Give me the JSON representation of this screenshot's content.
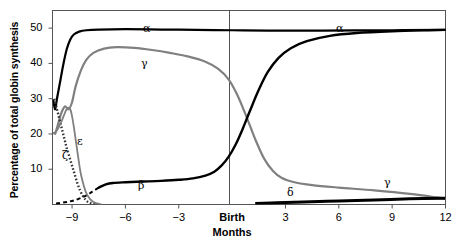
{
  "chart_data": {
    "type": "line",
    "title": "",
    "xlabel": "Months",
    "ylabel": "Percentage of total globin synthesis",
    "xlim": [
      -10.1,
      12
    ],
    "ylim": [
      0,
      55
    ],
    "grid": false,
    "legend_position": "inline-annotations",
    "x_ticks": [
      -9,
      -6,
      -3,
      0,
      3,
      6,
      9,
      12
    ],
    "x_tick_labels": [
      "−9",
      "−6",
      "−3",
      "Birth",
      "3",
      "6",
      "9",
      "12"
    ],
    "y_ticks": [
      10,
      20,
      30,
      40,
      50
    ],
    "y_tick_labels": [
      "10",
      "20",
      "30",
      "40",
      "50"
    ],
    "birth_marker_x": 0,
    "series": [
      {
        "name": "alpha",
        "label": "α",
        "color": "#000000",
        "style": "solid",
        "points": [
          [
            -10.05,
            29.5
          ],
          [
            -9.95,
            27.0
          ],
          [
            -9.85,
            30.0
          ],
          [
            -9.7,
            34.0
          ],
          [
            -9.5,
            39.5
          ],
          [
            -9.3,
            44.0
          ],
          [
            -9.1,
            46.8
          ],
          [
            -8.9,
            48.2
          ],
          [
            -8.6,
            49.0
          ],
          [
            -8.2,
            49.4
          ],
          [
            -7.5,
            49.6
          ],
          [
            -6.0,
            49.7
          ],
          [
            -4.0,
            49.6
          ],
          [
            -2.0,
            49.5
          ],
          [
            0.0,
            49.4
          ],
          [
            2.0,
            49.3
          ],
          [
            5.0,
            49.3
          ],
          [
            9.0,
            49.4
          ],
          [
            12.0,
            49.5
          ]
        ]
      },
      {
        "name": "gamma",
        "label": "γ",
        "color": "#808080",
        "style": "solid",
        "points": [
          [
            -9.95,
            20.0
          ],
          [
            -9.8,
            22.5
          ],
          [
            -9.6,
            26.0
          ],
          [
            -9.4,
            27.8
          ],
          [
            -9.2,
            27.0
          ],
          [
            -9.0,
            29.0
          ],
          [
            -8.8,
            33.5
          ],
          [
            -8.5,
            38.0
          ],
          [
            -8.2,
            41.0
          ],
          [
            -7.8,
            43.0
          ],
          [
            -7.2,
            44.2
          ],
          [
            -6.5,
            44.6
          ],
          [
            -5.5,
            44.4
          ],
          [
            -4.5,
            43.8
          ],
          [
            -3.5,
            43.0
          ],
          [
            -2.5,
            42.0
          ],
          [
            -1.5,
            40.5
          ],
          [
            -0.8,
            38.5
          ],
          [
            -0.2,
            35.5
          ],
          [
            0.3,
            31.0
          ],
          [
            0.8,
            25.0
          ],
          [
            1.3,
            18.5
          ],
          [
            1.8,
            13.0
          ],
          [
            2.3,
            9.5
          ],
          [
            2.8,
            7.5
          ],
          [
            3.5,
            6.3
          ],
          [
            4.5,
            5.5
          ],
          [
            6.0,
            4.8
          ],
          [
            8.0,
            4.0
          ],
          [
            10.0,
            3.0
          ],
          [
            11.5,
            2.0
          ],
          [
            12.0,
            1.6
          ]
        ]
      },
      {
        "name": "beta",
        "label": "β",
        "color": "#000000",
        "style": "mixed-dashed-solid",
        "points": [
          [
            -9.9,
            0.3
          ],
          [
            -9.3,
            0.7
          ],
          [
            -8.8,
            1.3
          ],
          [
            -8.3,
            2.3
          ],
          [
            -7.9,
            3.5
          ],
          [
            -7.5,
            4.8
          ],
          [
            -7.1,
            5.7
          ],
          [
            -6.7,
            6.1
          ],
          [
            -6.0,
            6.3
          ],
          [
            -5.0,
            6.5
          ],
          [
            -4.0,
            6.7
          ],
          [
            -3.0,
            7.0
          ],
          [
            -2.2,
            7.4
          ],
          [
            -1.5,
            8.2
          ],
          [
            -1.0,
            9.3
          ],
          [
            -0.6,
            11.0
          ],
          [
            -0.2,
            13.5
          ],
          [
            0.2,
            17.0
          ],
          [
            0.6,
            21.5
          ],
          [
            1.0,
            26.5
          ],
          [
            1.5,
            32.5
          ],
          [
            2.0,
            37.5
          ],
          [
            2.6,
            41.5
          ],
          [
            3.3,
            44.3
          ],
          [
            4.2,
            46.3
          ],
          [
            5.5,
            47.8
          ],
          [
            7.0,
            48.6
          ],
          [
            9.0,
            49.1
          ],
          [
            11.0,
            49.4
          ],
          [
            12.0,
            49.5
          ]
        ],
        "dashed_until_x": -7.7
      },
      {
        "name": "epsilon",
        "label": "ε",
        "color": "#333333",
        "style": "dotted",
        "points": [
          [
            -10.0,
            30.0
          ],
          [
            -9.9,
            28.0
          ],
          [
            -9.8,
            26.0
          ],
          [
            -9.7,
            24.0
          ],
          [
            -9.6,
            22.0
          ],
          [
            -9.5,
            20.0
          ],
          [
            -9.4,
            18.0
          ],
          [
            -9.3,
            16.0
          ],
          [
            -9.15,
            13.5
          ],
          [
            -9.0,
            11.0
          ],
          [
            -8.85,
            8.5
          ],
          [
            -8.7,
            6.0
          ],
          [
            -8.55,
            4.0
          ],
          [
            -8.4,
            2.5
          ],
          [
            -8.25,
            1.4
          ],
          [
            -8.1,
            0.7
          ],
          [
            -7.9,
            0.3
          ],
          [
            -7.7,
            0.1
          ]
        ]
      },
      {
        "name": "zeta",
        "label": "ζ",
        "color": "#808080",
        "style": "solid",
        "points": [
          [
            -10.05,
            20.2
          ],
          [
            -9.85,
            21.0
          ],
          [
            -9.6,
            23.5
          ],
          [
            -9.4,
            26.0
          ],
          [
            -9.25,
            27.4
          ],
          [
            -9.1,
            27.0
          ],
          [
            -9.0,
            25.0
          ],
          [
            -8.9,
            22.0
          ],
          [
            -8.8,
            18.5
          ],
          [
            -8.7,
            15.0
          ],
          [
            -8.6,
            11.5
          ],
          [
            -8.5,
            8.5
          ],
          [
            -8.35,
            5.5
          ],
          [
            -8.2,
            3.2
          ],
          [
            -8.0,
            1.6
          ],
          [
            -7.8,
            0.7
          ],
          [
            -7.6,
            0.3
          ],
          [
            -7.4,
            0.1
          ]
        ]
      },
      {
        "name": "delta",
        "label": "δ",
        "color": "#000000",
        "style": "solid-thick",
        "points": [
          [
            1.3,
            0.3
          ],
          [
            2.5,
            0.5
          ],
          [
            4.0,
            0.7
          ],
          [
            6.0,
            1.0
          ],
          [
            8.0,
            1.3
          ],
          [
            10.0,
            1.6
          ],
          [
            12.0,
            1.8
          ]
        ]
      }
    ],
    "annotations": [
      {
        "text": "α",
        "x": 143,
        "y": 22,
        "name": "alpha-label-left"
      },
      {
        "text": "α",
        "x": 336,
        "y": 22,
        "name": "alpha-label-right"
      },
      {
        "text": "γ",
        "x": 141,
        "y": 57,
        "name": "gamma-label-left"
      },
      {
        "text": "γ",
        "x": 384,
        "y": 176,
        "name": "gamma-label-right"
      },
      {
        "text": "β",
        "x": 138,
        "y": 179,
        "name": "beta-label"
      },
      {
        "text": "ε",
        "x": 77,
        "y": 135,
        "name": "epsilon-label"
      },
      {
        "text": "ζ",
        "x": 62,
        "y": 149,
        "name": "zeta-label"
      },
      {
        "text": "δ",
        "x": 287,
        "y": 186,
        "name": "delta-label"
      }
    ]
  }
}
